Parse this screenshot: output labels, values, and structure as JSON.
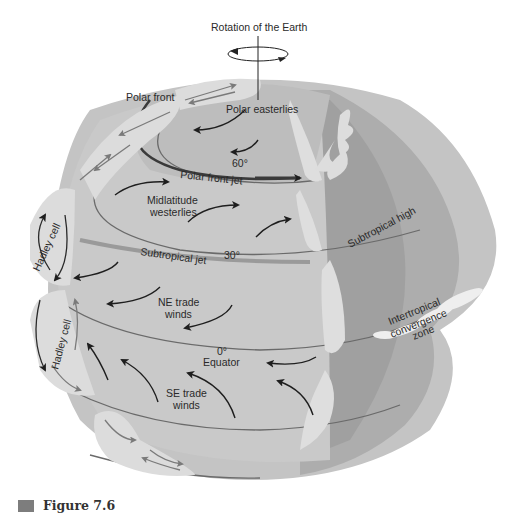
{
  "figure": {
    "caption": "Figure 7.6",
    "title": "Rotation of the Earth"
  },
  "labels": {
    "rotation": "Rotation of the Earth",
    "polar_front": "Polar front",
    "polar_easterlies": "Polar easterlies",
    "lat_60": "60°",
    "polar_front_jet": "Polar front jet",
    "midlatitude_1": "Midlatitude",
    "midlatitude_2": "westerlies",
    "subtropical_high": "Subtropical high",
    "subtropical_jet": "Subtropical jet",
    "lat_30": "30°",
    "ne_trade_1": "NE trade",
    "ne_trade_2": "winds",
    "hadley_cell_upper": "Hadley cell",
    "hadley_cell_lower": "Hadley cell",
    "itcz_1": "Intertropical",
    "itcz_2": "convergence",
    "itcz_3": "zone",
    "lat_0": "0°",
    "equator": "Equator",
    "se_trade_1": "SE trade",
    "se_trade_2": "winds"
  },
  "colors": {
    "globe_light": "#c9c9c9",
    "globe_mid": "#b3b3b3",
    "globe_dark": "#a2a2a2",
    "cell_fill": "#dcdcdc",
    "arrow": "#1e1e1e",
    "cell_arrow": "#7a7a7a",
    "band_line": "#6a6a6a"
  }
}
